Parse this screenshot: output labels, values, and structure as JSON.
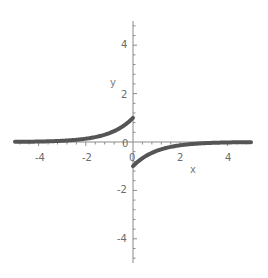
{
  "chart_data": {
    "type": "line",
    "title": "",
    "xlabel": "x",
    "ylabel": "y",
    "xlim": [
      -5,
      5
    ],
    "ylim": [
      -5,
      5
    ],
    "grid": false,
    "legend": null,
    "x_ticks": [
      -4,
      -2,
      0,
      2,
      4
    ],
    "y_ticks": [
      -4,
      -2,
      0,
      2,
      4
    ],
    "x_tick_labels": [
      "-4",
      "-2",
      "0",
      "2",
      "4"
    ],
    "y_tick_labels": [
      "-4",
      "-2",
      "0",
      "2",
      "4"
    ],
    "series": [
      {
        "name": "left branch (x<0), y = e^x",
        "x": [
          -5,
          -4,
          -3,
          -2,
          -1.5,
          -1,
          -0.5,
          0
        ],
        "y": [
          0.007,
          0.018,
          0.05,
          0.135,
          0.223,
          0.368,
          0.607,
          1.0
        ]
      },
      {
        "name": "right branch (x>0), y = -e^(-x)",
        "x": [
          0,
          0.5,
          1,
          1.5,
          2,
          3,
          4,
          5
        ],
        "y": [
          -1.0,
          -0.607,
          -0.368,
          -0.223,
          -0.135,
          -0.05,
          -0.018,
          -0.007
        ]
      }
    ],
    "colors": {
      "curve": "#555555",
      "axis": "#8a8a8a",
      "labels": "#6b6b6b"
    }
  },
  "axes": {
    "x_label": "x",
    "y_label": "y",
    "origin_label_x": "0",
    "origin_label_y": "0",
    "x_tick_labels": [
      "-4",
      "-2",
      "2",
      "4"
    ],
    "y_tick_labels": [
      "4",
      "2",
      "-2",
      "-4"
    ]
  }
}
